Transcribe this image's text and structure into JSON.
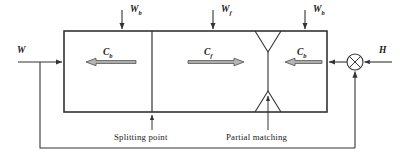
{
  "figure": {
    "type": "block-flow-diagram",
    "stroke_color": "#333333",
    "fill_color": "#b5b5b5",
    "background": "#ffffff"
  },
  "top_inputs": [
    {
      "id": "wb-left",
      "symbol": "W",
      "subscript": "b",
      "x": 122,
      "arrow_y_from": 10,
      "arrow_y_to": 31
    },
    {
      "id": "wf-mid",
      "symbol": "W",
      "subscript": "f",
      "x": 213,
      "arrow_y_from": 10,
      "arrow_y_to": 31
    },
    {
      "id": "wb-right",
      "symbol": "W",
      "subscript": "b",
      "x": 305,
      "arrow_y_from": 10,
      "arrow_y_to": 31
    }
  ],
  "left_input": {
    "id": "w-in",
    "symbol": "W",
    "subscript": ""
  },
  "right_input": {
    "id": "h-in",
    "symbol": "H",
    "subscript": ""
  },
  "internal_flows": [
    {
      "id": "cb-left",
      "symbol": "C",
      "subscript": "b",
      "direction": "left"
    },
    {
      "id": "cf-mid",
      "symbol": "C",
      "subscript": "f",
      "direction": "right"
    },
    {
      "id": "cb-right",
      "symbol": "C",
      "subscript": "b",
      "direction": "left"
    }
  ],
  "annotations": [
    {
      "id": "splitting-point",
      "text": "Splitting point"
    },
    {
      "id": "partial-matching",
      "text": "Partial matching"
    }
  ],
  "junction": {
    "id": "summing-junction",
    "glyph": "cross-circle"
  },
  "feedback_loop": {
    "id": "feedback-path",
    "present": true
  }
}
